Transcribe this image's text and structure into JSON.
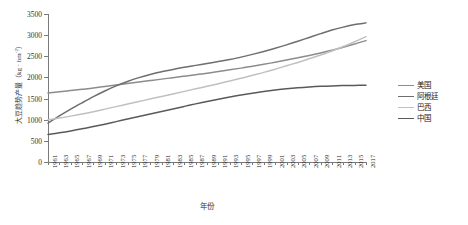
{
  "chart_data": {
    "type": "line",
    "title": "",
    "xlabel": "年份",
    "ylabel": "大豆趋势产量（kg · hm⁻²）",
    "ylabel_main": "大豆趋势产量（kg · hm",
    "ylabel_sup": "-2",
    "ylabel_tail": "）",
    "xlim": [
      1961,
      2017
    ],
    "ylim": [
      0,
      3500
    ],
    "grid": false,
    "legend_position": "right",
    "x": [
      1961,
      1963,
      1965,
      1967,
      1969,
      1971,
      1973,
      1975,
      1977,
      1979,
      1981,
      1983,
      1985,
      1987,
      1989,
      1991,
      1993,
      1995,
      1997,
      1999,
      2001,
      2003,
      2005,
      2007,
      2009,
      2011,
      2013,
      2015,
      2017
    ],
    "xtick_labels": [
      "1961",
      "1963",
      "1965",
      "1967",
      "1969",
      "1971",
      "1973",
      "1975",
      "1977",
      "1979",
      "1981",
      "1983",
      "1985",
      "1987",
      "1989",
      "1991",
      "1993",
      "1995",
      "1997",
      "1999",
      "2001",
      "2003",
      "2005",
      "2007",
      "2009",
      "2011",
      "2013",
      "2015",
      "2017"
    ],
    "ytick_labels": [
      "0",
      "500",
      "1000",
      "1500",
      "2000",
      "2500",
      "3000",
      "3500"
    ],
    "ytick_values": [
      0,
      500,
      1000,
      1500,
      2000,
      2500,
      3000,
      3500
    ],
    "series": [
      {
        "name": "美国",
        "color": "#8c8c8c",
        "values": [
          1630,
          1660,
          1690,
          1720,
          1750,
          1785,
          1820,
          1855,
          1890,
          1925,
          1960,
          1995,
          2030,
          2065,
          2100,
          2140,
          2180,
          2220,
          2265,
          2310,
          2360,
          2410,
          2465,
          2520,
          2580,
          2645,
          2715,
          2790,
          2870
        ]
      },
      {
        "name": "阿根廷",
        "color": "#6e6e6e",
        "values": [
          920,
          1090,
          1250,
          1400,
          1545,
          1680,
          1800,
          1905,
          1995,
          2070,
          2135,
          2190,
          2240,
          2285,
          2330,
          2375,
          2425,
          2480,
          2545,
          2615,
          2690,
          2770,
          2855,
          2945,
          3035,
          3120,
          3190,
          3250,
          3290
        ]
      },
      {
        "name": "巴西",
        "color": "#c0c0c0",
        "values": [
          1000,
          1040,
          1085,
          1135,
          1190,
          1250,
          1310,
          1370,
          1430,
          1490,
          1550,
          1610,
          1670,
          1730,
          1790,
          1850,
          1915,
          1980,
          2050,
          2120,
          2195,
          2275,
          2355,
          2440,
          2530,
          2625,
          2730,
          2845,
          2965
        ]
      },
      {
        "name": "中国",
        "color": "#5a5a5a",
        "values": [
          650,
          690,
          735,
          785,
          840,
          895,
          955,
          1015,
          1075,
          1135,
          1195,
          1255,
          1315,
          1375,
          1430,
          1485,
          1535,
          1585,
          1625,
          1665,
          1700,
          1730,
          1755,
          1775,
          1790,
          1800,
          1808,
          1812,
          1815
        ]
      }
    ]
  },
  "legend": {
    "items": [
      {
        "label": "美国",
        "color": "#8c8c8c"
      },
      {
        "label": "阿根廷",
        "color": "#6e6e6e"
      },
      {
        "label": "巴西",
        "color": "#c0c0c0"
      },
      {
        "label": "中国",
        "color": "#5a5a5a"
      }
    ]
  }
}
